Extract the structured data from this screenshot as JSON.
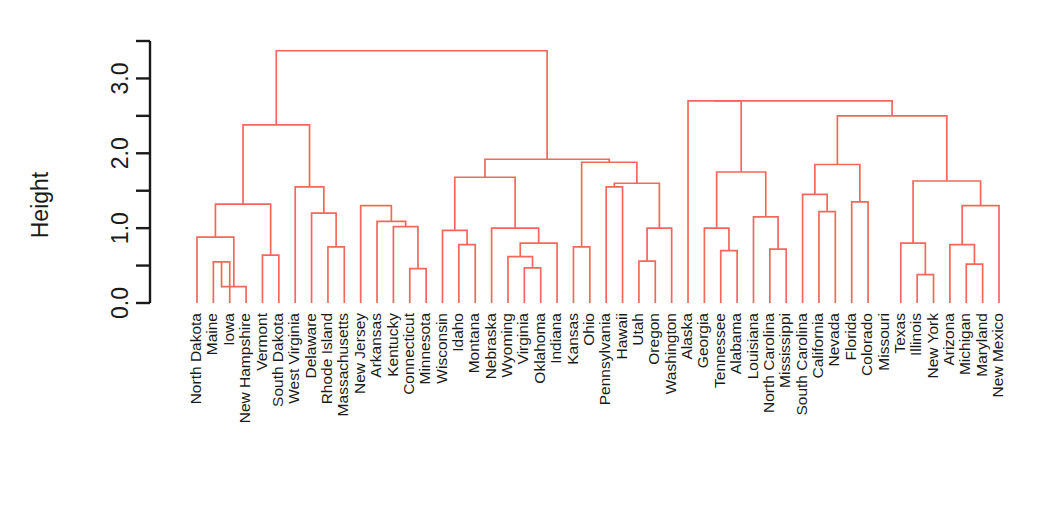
{
  "chart_data": {
    "type": "dendrogram",
    "title": "",
    "subtitle": "",
    "xlabel": "",
    "ylabel": "Height",
    "ylim": [
      0.0,
      3.5
    ],
    "yticks": [
      "0.0",
      "1.0",
      "2.0",
      "3.0"
    ],
    "ytick_values": [
      0.0,
      1.0,
      2.0,
      3.0
    ],
    "yminor_values": [
      0.5,
      1.5,
      2.5,
      3.5
    ],
    "grid": false,
    "legend": "none",
    "line_color": "#F4685C",
    "axis_color": "#1a1a1a",
    "leaf_order": [
      "North Dakota",
      "Maine",
      "Iowa",
      "New Hampshire",
      "Vermont",
      "South Dakota",
      "West Virginia",
      "Delaware",
      "Rhode Island",
      "Massachusetts",
      "New Jersey",
      "Arkansas",
      "Kentucky",
      "Connecticut",
      "Minnesota",
      "Wisconsin",
      "Idaho",
      "Montana",
      "Nebraska",
      "Wyoming",
      "Virginia",
      "Oklahoma",
      "Indiana",
      "Kansas",
      "Ohio",
      "Pennsylvania",
      "Hawaii",
      "Utah",
      "Oregon",
      "Washington",
      "Alaska",
      "Georgia",
      "Tennessee",
      "Alabama",
      "Louisiana",
      "North Carolina",
      "Mississippi",
      "South Carolina",
      "California",
      "Nevada",
      "Florida",
      "Colorado",
      "Missouri",
      "Texas",
      "Illinois",
      "New York",
      "Arizona",
      "Michigan",
      "Maryland",
      "New Mexico"
    ],
    "merges": [
      {
        "id": "m1",
        "left": "leaf:1",
        "right": "leaf:2",
        "height": 0.55
      },
      {
        "id": "m2",
        "left": "m1",
        "right": "leaf:3",
        "height": 0.22
      },
      {
        "id": "m3",
        "left": "leaf:0",
        "right": "m2",
        "height": 0.88
      },
      {
        "id": "m4",
        "left": "leaf:4",
        "right": "leaf:5",
        "height": 0.64
      },
      {
        "id": "m5",
        "left": "m3",
        "right": "m4",
        "height": 1.32
      },
      {
        "id": "m6",
        "left": "leaf:8",
        "right": "leaf:9",
        "height": 0.75
      },
      {
        "id": "m7",
        "left": "leaf:7",
        "right": "m6",
        "height": 1.2
      },
      {
        "id": "m8",
        "left": "leaf:6",
        "right": "m7",
        "height": 1.55
      },
      {
        "id": "m9",
        "left": "m5",
        "right": "m8",
        "height": 2.38
      },
      {
        "id": "m10",
        "left": "leaf:13",
        "right": "leaf:14",
        "height": 0.46
      },
      {
        "id": "m11",
        "left": "leaf:12",
        "right": "m10",
        "height": 1.02
      },
      {
        "id": "m12",
        "left": "leaf:11",
        "right": "m11",
        "height": 1.09
      },
      {
        "id": "m13",
        "left": "leaf:10",
        "right": "m12",
        "height": 1.3
      },
      {
        "id": "m14",
        "left": "leaf:16",
        "right": "leaf:17",
        "height": 0.78
      },
      {
        "id": "m15",
        "left": "leaf:15",
        "right": "m14",
        "height": 0.97
      },
      {
        "id": "m16",
        "left": "leaf:20",
        "right": "leaf:21",
        "height": 0.47
      },
      {
        "id": "m17",
        "left": "leaf:19",
        "right": "m16",
        "height": 0.62
      },
      {
        "id": "m18",
        "left": "m17",
        "right": "leaf:22",
        "height": 0.8
      },
      {
        "id": "m19",
        "left": "leaf:18",
        "right": "m18",
        "height": 1.0
      },
      {
        "id": "m20",
        "left": "m15",
        "right": "m19",
        "height": 1.68
      },
      {
        "id": "m21",
        "left": "leaf:23",
        "right": "leaf:24",
        "height": 0.75
      },
      {
        "id": "m22",
        "left": "leaf:25",
        "right": "leaf:26",
        "height": 1.55
      },
      {
        "id": "m23",
        "left": "leaf:27",
        "right": "leaf:28",
        "height": 0.56
      },
      {
        "id": "m24",
        "left": "m23",
        "right": "leaf:29",
        "height": 1.0
      },
      {
        "id": "m25",
        "left": "m22",
        "right": "m24",
        "height": 1.6
      },
      {
        "id": "m26",
        "left": "m21",
        "right": "m25",
        "height": 1.88
      },
      {
        "id": "m27",
        "left": "m20",
        "right": "m26",
        "height": 1.92
      },
      {
        "id": "m28",
        "left": "m9",
        "right": "m27",
        "height": 3.37
      },
      {
        "id": "m29",
        "left": "leaf:32",
        "right": "leaf:33",
        "height": 0.7
      },
      {
        "id": "m30",
        "left": "leaf:31",
        "right": "m29",
        "height": 1.0
      },
      {
        "id": "m31",
        "left": "leaf:35",
        "right": "leaf:36",
        "height": 0.72
      },
      {
        "id": "m32",
        "left": "leaf:34",
        "right": "m31",
        "height": 1.15
      },
      {
        "id": "m33",
        "left": "m30",
        "right": "m32",
        "height": 1.75
      },
      {
        "id": "m34",
        "left": "leaf:30",
        "right": "m33",
        "height": 2.7
      },
      {
        "id": "m35",
        "left": "leaf:38",
        "right": "leaf:39",
        "height": 1.22
      },
      {
        "id": "m36",
        "left": "leaf:37",
        "right": "m35",
        "height": 1.45
      },
      {
        "id": "m37",
        "left": "leaf:40",
        "right": "leaf:41",
        "height": 1.35
      },
      {
        "id": "m38",
        "left": "m36",
        "right": "m37",
        "height": 1.85
      },
      {
        "id": "m39",
        "left": "leaf:44",
        "right": "leaf:45",
        "height": 0.38
      },
      {
        "id": "m40",
        "left": "leaf:43",
        "right": "m39",
        "height": 0.8
      },
      {
        "id": "m41",
        "left": "leaf:47",
        "right": "leaf:48",
        "height": 0.52
      },
      {
        "id": "m42",
        "left": "leaf:46",
        "right": "m41",
        "height": 0.78
      },
      {
        "id": "m43",
        "left": "m42",
        "right": "leaf:49",
        "height": 1.3
      },
      {
        "id": "m44",
        "left": "m40",
        "right": "m43",
        "height": 1.63
      },
      {
        "id": "m45",
        "left": "m38",
        "right": "m44",
        "height": 2.5
      },
      {
        "id": "m46",
        "left": "m34",
        "right": "m45",
        "height": 2.7
      }
    ]
  },
  "axis": {
    "y_title": "Height",
    "tick_0": "0.0",
    "tick_1": "1.0",
    "tick_2": "2.0",
    "tick_3": "3.0"
  }
}
